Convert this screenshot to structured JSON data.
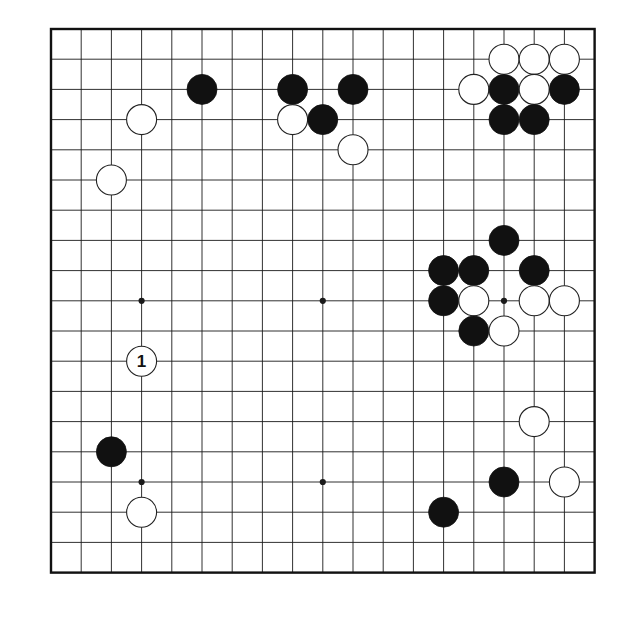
{
  "app": {
    "title": "Go Board Diagram",
    "kind": "go-game-record"
  },
  "board": {
    "size": 19,
    "origin_x": 51,
    "origin_y": 29,
    "spacing": 30.2,
    "stone_radius": 15,
    "background_color": "#ffffff",
    "line_color": "#1a1a1a",
    "border_color": "#111111",
    "black_color": "#111111",
    "white_color": "#ffffff",
    "white_edge_color": "#222222",
    "star_points": [
      {
        "col": 3,
        "row": 3
      },
      {
        "col": 9,
        "row": 3
      },
      {
        "col": 15,
        "row": 3
      },
      {
        "col": 3,
        "row": 9
      },
      {
        "col": 9,
        "row": 9
      },
      {
        "col": 15,
        "row": 9
      },
      {
        "col": 3,
        "row": 15
      },
      {
        "col": 9,
        "row": 15
      },
      {
        "col": 15,
        "row": 15
      }
    ],
    "visible_star_points": [
      {
        "col": 3,
        "row": 9
      },
      {
        "col": 9,
        "row": 9
      },
      {
        "col": 15,
        "row": 9
      },
      {
        "col": 3,
        "row": 15
      },
      {
        "col": 9,
        "row": 15
      }
    ]
  },
  "stones": [
    {
      "col": 15,
      "row": 1,
      "color": "white",
      "label": ""
    },
    {
      "col": 16,
      "row": 1,
      "color": "white",
      "label": ""
    },
    {
      "col": 17,
      "row": 1,
      "color": "white",
      "label": ""
    },
    {
      "col": 5,
      "row": 2,
      "color": "black",
      "label": ""
    },
    {
      "col": 8,
      "row": 2,
      "color": "black",
      "label": ""
    },
    {
      "col": 10,
      "row": 2,
      "color": "black",
      "label": ""
    },
    {
      "col": 14,
      "row": 2,
      "color": "white",
      "label": ""
    },
    {
      "col": 15,
      "row": 2,
      "color": "black",
      "label": ""
    },
    {
      "col": 16,
      "row": 2,
      "color": "white",
      "label": ""
    },
    {
      "col": 17,
      "row": 2,
      "color": "black",
      "label": ""
    },
    {
      "col": 3,
      "row": 3,
      "color": "white",
      "label": ""
    },
    {
      "col": 8,
      "row": 3,
      "color": "white",
      "label": ""
    },
    {
      "col": 9,
      "row": 3,
      "color": "black",
      "label": ""
    },
    {
      "col": 15,
      "row": 3,
      "color": "black",
      "label": ""
    },
    {
      "col": 16,
      "row": 3,
      "color": "black",
      "label": ""
    },
    {
      "col": 10,
      "row": 4,
      "color": "white",
      "label": ""
    },
    {
      "col": 2,
      "row": 5,
      "color": "white",
      "label": ""
    },
    {
      "col": 15,
      "row": 7,
      "color": "black",
      "label": ""
    },
    {
      "col": 13,
      "row": 8,
      "color": "black",
      "label": ""
    },
    {
      "col": 14,
      "row": 8,
      "color": "black",
      "label": ""
    },
    {
      "col": 16,
      "row": 8,
      "color": "black",
      "label": ""
    },
    {
      "col": 13,
      "row": 9,
      "color": "black",
      "label": ""
    },
    {
      "col": 14,
      "row": 9,
      "color": "white",
      "label": ""
    },
    {
      "col": 16,
      "row": 9,
      "color": "white",
      "label": ""
    },
    {
      "col": 17,
      "row": 9,
      "color": "white",
      "label": ""
    },
    {
      "col": 14,
      "row": 10,
      "color": "black",
      "label": ""
    },
    {
      "col": 15,
      "row": 10,
      "color": "white",
      "label": ""
    },
    {
      "col": 3,
      "row": 11,
      "color": "white",
      "label": "1"
    },
    {
      "col": 16,
      "row": 13,
      "color": "white",
      "label": ""
    },
    {
      "col": 2,
      "row": 14,
      "color": "black",
      "label": ""
    },
    {
      "col": 15,
      "row": 15,
      "color": "black",
      "label": ""
    },
    {
      "col": 17,
      "row": 15,
      "color": "white",
      "label": ""
    },
    {
      "col": 3,
      "row": 16,
      "color": "white",
      "label": ""
    },
    {
      "col": 13,
      "row": 16,
      "color": "black",
      "label": ""
    }
  ],
  "move_markers": [
    {
      "label": "1",
      "col": 3,
      "row": 11,
      "color": "white"
    }
  ]
}
